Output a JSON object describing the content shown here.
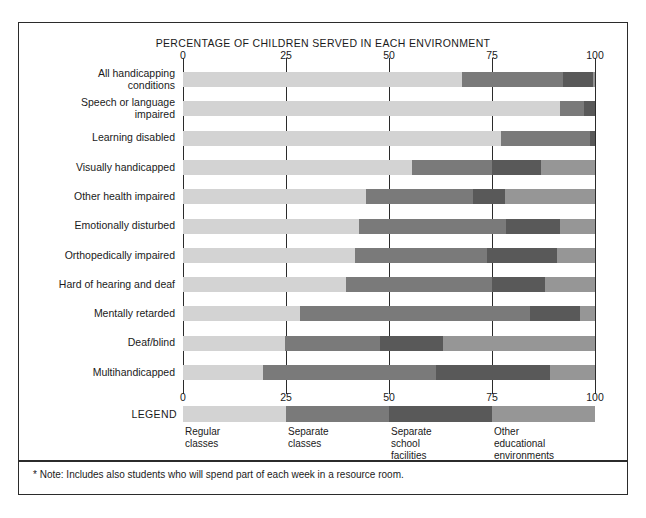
{
  "chart_data": {
    "type": "bar",
    "orientation": "horizontal",
    "stacked": true,
    "title": "PERCENTAGE OF CHILDREN SERVED IN EACH ENVIRONMENT",
    "xlabel": "",
    "ylabel": "",
    "xlim": [
      0,
      100
    ],
    "ticks": [
      0,
      25,
      50,
      75,
      100
    ],
    "tick_labels": [
      "0",
      "25",
      "50",
      "75",
      "100"
    ],
    "grid": true,
    "legend_position": "bottom",
    "categories": [
      "All handicapping\nconditions",
      "Speech or language\nimpaired",
      "Learning disabled",
      "Visually handicapped",
      "Other health impaired",
      "Emotionally disturbed",
      "Orthopedically impaired",
      "Hard of hearing and deaf",
      "Mentally retarded",
      "Deaf/blind",
      "Multihandicapped"
    ],
    "series": [
      {
        "name": "Regular classes",
        "color": "#d3d3d3",
        "values": [
          67.8,
          91.4,
          77.2,
          55.5,
          44.5,
          42.8,
          41.7,
          39.5,
          28.3,
          24.7,
          19.4
        ]
      },
      {
        "name": "Separate classes",
        "color": "#7a7a7a",
        "values": [
          24.5,
          6.0,
          21.6,
          19.4,
          25.9,
          35.7,
          32.0,
          35.4,
          55.9,
          23.1,
          42.1
        ]
      },
      {
        "name": "Separate school facilities",
        "color": "#595959",
        "values": [
          7.3,
          2.6,
          1.2,
          12.1,
          7.7,
          13.0,
          17.0,
          13.0,
          12.2,
          15.3,
          27.6
        ]
      },
      {
        "name": "Other educational environments",
        "color": "#969696",
        "values": [
          0.4,
          0.0,
          0.0,
          13.0,
          21.9,
          8.5,
          9.3,
          12.1,
          3.6,
          36.9,
          10.9
        ]
      }
    ]
  },
  "legend": {
    "title": "LEGEND",
    "items": [
      {
        "label": "Regular\nclasses",
        "color": "#d3d3d3"
      },
      {
        "label": "Separate\nclasses",
        "color": "#7a7a7a"
      },
      {
        "label": "Separate\nschool\nfacilities",
        "color": "#595959"
      },
      {
        "label": "Other\neducational\nenvironments",
        "color": "#969696"
      }
    ]
  },
  "footnote": "* Note: Includes also students who will spend part of each week in a resource room."
}
